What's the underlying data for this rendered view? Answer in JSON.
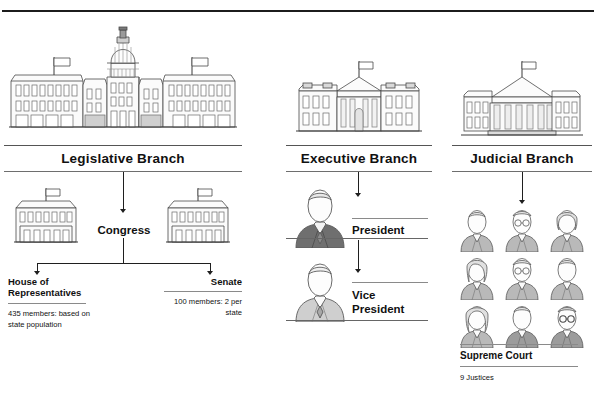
{
  "document": {
    "title": "The Three Branches of Government"
  },
  "branches": [
    {
      "id": "legislative",
      "title": "Legislative Branch",
      "building_icon": "capitol-building-icon",
      "node": {
        "label": "Congress"
      },
      "children": [
        {
          "id": "house",
          "label": "House of Representatives",
          "detail": "435 members: based on state population",
          "icon": "congress-building-icon"
        },
        {
          "id": "senate",
          "label": "Senate",
          "detail": "100 members: 2 per state",
          "icon": "congress-building-icon"
        }
      ]
    },
    {
      "id": "executive",
      "title": "Executive Branch",
      "building_icon": "white-house-icon",
      "children": [
        {
          "id": "president",
          "label": "President",
          "icon": "person-dark-suit-icon"
        },
        {
          "id": "vice-president",
          "label": "Vice President",
          "icon": "person-light-suit-icon"
        }
      ]
    },
    {
      "id": "judicial",
      "title": "Judicial Branch",
      "building_icon": "supreme-court-building-icon",
      "children": [
        {
          "id": "supreme-court",
          "label": "Supreme Court",
          "detail": "9 Justices",
          "justice_count": 9,
          "icon": "justice-person-icon"
        }
      ]
    }
  ],
  "colors": {
    "ink": "#111111",
    "rule": "#1c1c1c",
    "thin_rule": "#6e6e6e",
    "figure_fill": "#b9b9b9",
    "figure_dark": "#6f6f6f",
    "building_fill": "#f2f2f2"
  }
}
